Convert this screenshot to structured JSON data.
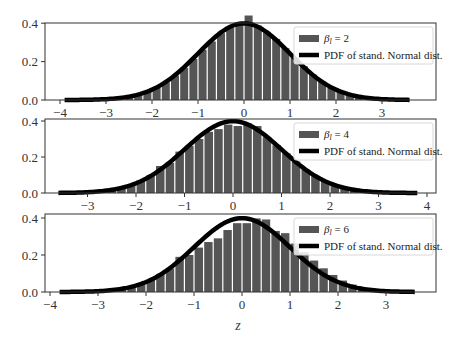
{
  "chart_data": [
    {
      "type": "bar",
      "title": "",
      "xlabel": "",
      "ylabel": "",
      "xlim": [
        -4.1,
        4.15
      ],
      "ylim": [
        0,
        0.47
      ],
      "yticks": [
        0.0,
        0.2,
        0.4
      ],
      "ytick_labels": [
        "0.0",
        "0.2",
        "0.4"
      ],
      "xticks": [
        -4,
        -3,
        -2,
        -1,
        0,
        1,
        2,
        3
      ],
      "xtick_labels": [
        "−4",
        "−3",
        "−2",
        "−1",
        "0",
        "1",
        "2",
        "3"
      ],
      "legend": [
        "β_l = 2",
        "PDF of stand. Normal dist."
      ],
      "legend_position": "upper right",
      "bin_width": 0.2,
      "x": [
        -3.9,
        -3.7,
        -3.5,
        -3.3,
        -3.1,
        -2.9,
        -2.7,
        -2.5,
        -2.3,
        -2.1,
        -1.9,
        -1.7,
        -1.5,
        -1.3,
        -1.1,
        -0.9,
        -0.7,
        -0.5,
        -0.3,
        -0.1,
        0.1,
        0.3,
        0.5,
        0.7,
        0.9,
        1.1,
        1.3,
        1.5,
        1.7,
        1.9,
        2.1,
        2.3,
        2.5,
        2.7,
        2.9,
        3.1,
        3.3,
        3.5
      ],
      "series": [
        {
          "name": "β_l = 2 histogram",
          "values": [
            0.001,
            0.001,
            0.002,
            0.002,
            0.003,
            0.006,
            0.01,
            0.018,
            0.028,
            0.044,
            0.066,
            0.092,
            0.127,
            0.168,
            0.214,
            0.262,
            0.305,
            0.348,
            0.378,
            0.392,
            0.44,
            0.388,
            0.352,
            0.318,
            0.27,
            0.222,
            0.176,
            0.132,
            0.096,
            0.066,
            0.043,
            0.027,
            0.017,
            0.01,
            0.006,
            0.003,
            0.002,
            0.001
          ]
        },
        {
          "name": "PDF of stand. Normal dist.",
          "type": "line",
          "x_range": [
            -3.9,
            3.6
          ],
          "peak": 0.399
        }
      ]
    },
    {
      "type": "bar",
      "title": "",
      "xlabel": "",
      "ylabel": "",
      "xlim": [
        -3.95,
        4.05
      ],
      "ylim": [
        0,
        0.43
      ],
      "yticks": [
        0.0,
        0.2,
        0.4
      ],
      "ytick_labels": [
        "0.0",
        "0.2",
        "0.4"
      ],
      "xticks": [
        -3,
        -2,
        -1,
        0,
        1,
        2,
        3,
        4
      ],
      "xtick_labels": [
        "−3",
        "−2",
        "−1",
        "0",
        "1",
        "2",
        "3",
        "4"
      ],
      "legend": [
        "β_l = 4",
        "PDF of stand. Normal dist."
      ],
      "legend_position": "upper right",
      "bin_width": 0.2,
      "x": [
        -3.5,
        -3.3,
        -3.1,
        -2.9,
        -2.7,
        -2.5,
        -2.3,
        -2.1,
        -1.9,
        -1.7,
        -1.5,
        -1.3,
        -1.1,
        -0.9,
        -0.7,
        -0.5,
        -0.3,
        -0.1,
        0.1,
        0.3,
        0.5,
        0.7,
        0.9,
        1.1,
        1.3,
        1.5,
        1.7,
        1.9,
        2.1,
        2.3,
        2.5,
        2.7,
        2.9,
        3.1,
        3.3,
        3.5,
        3.7
      ],
      "series": [
        {
          "name": "β_l = 4 histogram",
          "values": [
            0.001,
            0.002,
            0.003,
            0.006,
            0.01,
            0.017,
            0.028,
            0.045,
            0.07,
            0.098,
            0.15,
            0.168,
            0.23,
            0.262,
            0.3,
            0.34,
            0.355,
            0.38,
            0.372,
            0.388,
            0.372,
            0.31,
            0.265,
            0.22,
            0.175,
            0.13,
            0.096,
            0.066,
            0.044,
            0.027,
            0.017,
            0.01,
            0.006,
            0.003,
            0.002,
            0.001,
            0.001
          ]
        },
        {
          "name": "PDF of stand. Normal dist.",
          "type": "line",
          "x_range": [
            -3.6,
            3.8
          ],
          "peak": 0.399
        }
      ]
    },
    {
      "type": "bar",
      "title": "",
      "xlabel": "z",
      "ylabel": "",
      "xlim": [
        -4.2,
        4.0
      ],
      "ylim": [
        0,
        0.43
      ],
      "yticks": [
        0.0,
        0.2,
        0.4
      ],
      "ytick_labels": [
        "0.0",
        "0.2",
        "0.4"
      ],
      "xticks": [
        -4,
        -3,
        -2,
        -1,
        0,
        1,
        2,
        3
      ],
      "xtick_labels": [
        "−4",
        "−3",
        "−2",
        "−1",
        "0",
        "1",
        "2",
        "3"
      ],
      "legend": [
        "β_l = 6",
        "PDF of stand. Normal dist."
      ],
      "legend_position": "upper right",
      "bin_width": 0.2,
      "x": [
        -3.7,
        -3.5,
        -3.3,
        -3.1,
        -2.9,
        -2.7,
        -2.5,
        -2.3,
        -2.1,
        -1.9,
        -1.7,
        -1.5,
        -1.3,
        -1.1,
        -0.9,
        -0.7,
        -0.5,
        -0.3,
        -0.1,
        0.1,
        0.3,
        0.5,
        0.7,
        0.9,
        1.1,
        1.3,
        1.5,
        1.7,
        1.9,
        2.1,
        2.3,
        2.5,
        2.7,
        2.9,
        3.1,
        3.3,
        3.5
      ],
      "series": [
        {
          "name": "β_l = 6 histogram",
          "values": [
            0.001,
            0.002,
            0.003,
            0.004,
            0.006,
            0.01,
            0.016,
            0.026,
            0.042,
            0.064,
            0.096,
            0.128,
            0.19,
            0.2,
            0.24,
            0.27,
            0.29,
            0.335,
            0.372,
            0.372,
            0.398,
            0.392,
            0.33,
            0.318,
            0.262,
            0.215,
            0.17,
            0.128,
            0.092,
            0.062,
            0.04,
            0.025,
            0.015,
            0.009,
            0.005,
            0.003,
            0.002
          ]
        },
        {
          "name": "PDF of stand. Normal dist.",
          "type": "line",
          "x_range": [
            -3.8,
            3.6
          ],
          "peak": 0.399
        }
      ]
    }
  ],
  "figure": {
    "xlabel": "z",
    "bar_color": "#555555",
    "line_color": "#000000"
  },
  "panels": [
    {
      "legend_label_beta": "β",
      "legend_label_sub": "l",
      "legend_label_eq": " = 2",
      "legend_label_pdf": "PDF of stand. Normal dist."
    },
    {
      "legend_label_beta": "β",
      "legend_label_sub": "l",
      "legend_label_eq": " = 4",
      "legend_label_pdf": "PDF of stand. Normal dist."
    },
    {
      "legend_label_beta": "β",
      "legend_label_sub": "l",
      "legend_label_eq": " = 6",
      "legend_label_pdf": "PDF of stand. Normal dist."
    }
  ]
}
